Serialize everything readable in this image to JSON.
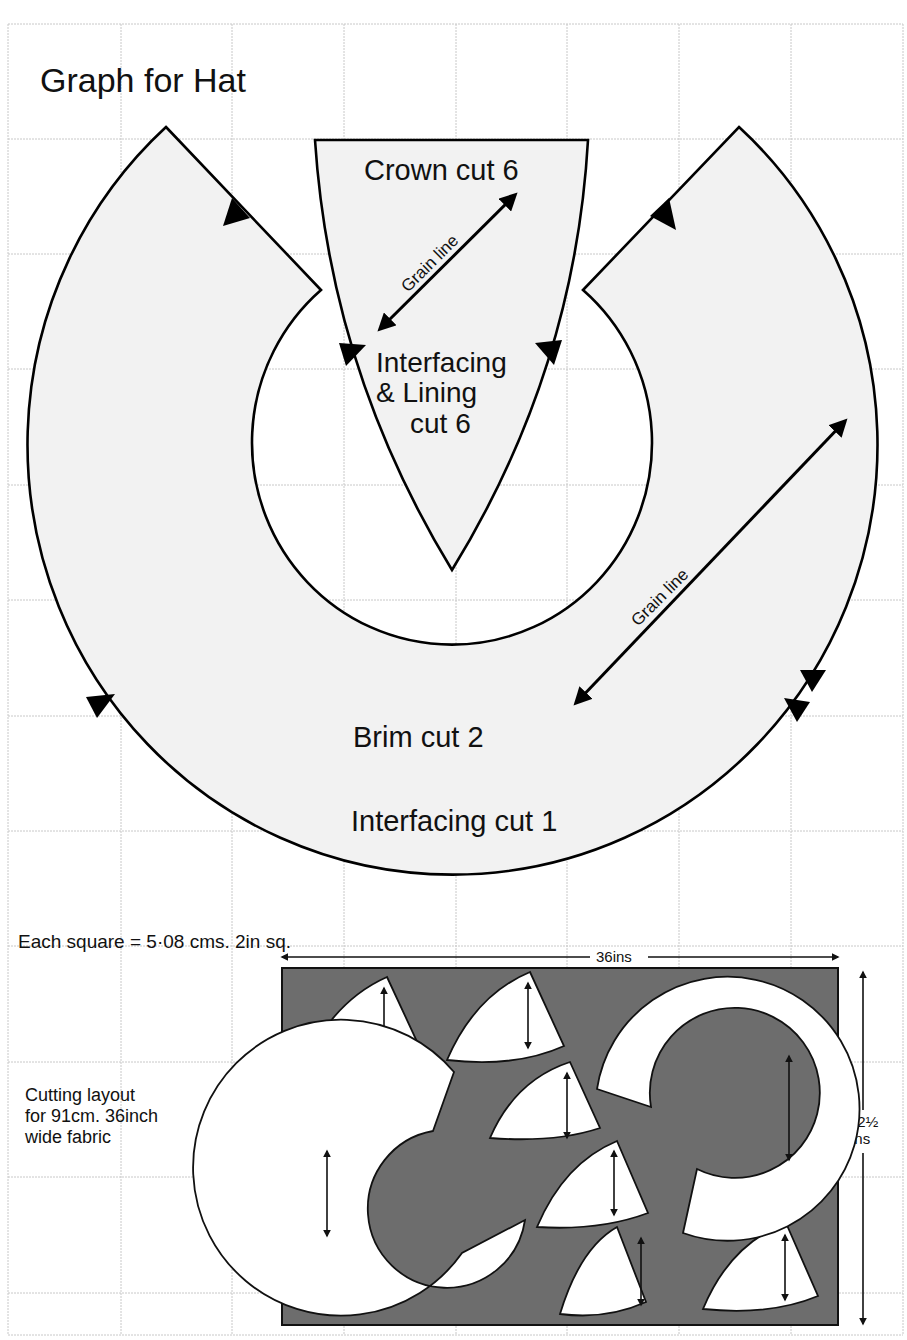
{
  "title": "Graph for Hat",
  "pattern": {
    "crown": {
      "label": "Crown cut 6",
      "grain_label": "Grain line",
      "lining_label_line1": "Interfacing",
      "lining_label_line2": "& Lining",
      "lining_label_line3": "cut 6"
    },
    "brim": {
      "grain_label": "Grain line",
      "label": "Brim cut 2",
      "interfacing_label": "Interfacing cut 1"
    }
  },
  "scale_note": "Each square = 5·08 cms. 2in sq.",
  "cutting_layout": {
    "caption_line1": "Cutting layout",
    "caption_line2": "for 91cm. 36inch",
    "caption_line3": "wide fabric",
    "width_label": "36ins",
    "height_label_line1": "22½",
    "height_label_line2": "ins",
    "pieces": {
      "crowns": 6,
      "brims": 2
    }
  },
  "colors": {
    "pattern_fill": "#f2f2f2",
    "fabric": "#6d6d6d",
    "grid": "#c8c8c8",
    "outline": "#000000"
  }
}
